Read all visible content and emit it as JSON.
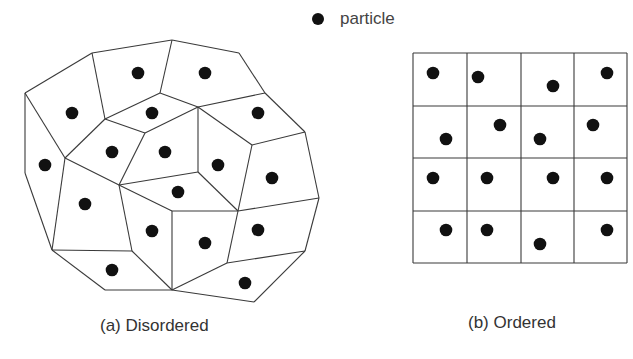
{
  "legend": {
    "marker": "filled-circle",
    "label": "particle"
  },
  "colors": {
    "line": "#3a3a3a",
    "particle": "#111111",
    "background": "#ffffff",
    "text": "#333333"
  },
  "panels": [
    {
      "id": "a",
      "caption": "(a) Disordered",
      "type": "voronoi-tessellation",
      "vertices": {
        "A": [
          25,
          93
        ],
        "B": [
          92,
          53
        ],
        "C": [
          172,
          40
        ],
        "D": [
          239,
          53
        ],
        "E": [
          265,
          93
        ],
        "F": [
          305,
          132
        ],
        "G": [
          319,
          198
        ],
        "H": [
          305,
          251
        ],
        "I": [
          254,
          302
        ],
        "J": [
          172,
          290
        ],
        "K": [
          105,
          290
        ],
        "L": [
          52,
          250
        ],
        "M": [
          25,
          173
        ],
        "N": [
          105,
          119
        ],
        "O": [
          160,
          93
        ],
        "P": [
          198,
          107
        ],
        "Q": [
          145,
          133
        ],
        "R": [
          65,
          158
        ],
        "S": [
          119,
          185
        ],
        "T": [
          252,
          145
        ],
        "U": [
          198,
          172
        ],
        "V": [
          238,
          211
        ],
        "W": [
          172,
          211
        ],
        "X": [
          132,
          251
        ],
        "Y": [
          227,
          263
        ]
      },
      "edges": [
        [
          "A",
          "B"
        ],
        [
          "B",
          "C"
        ],
        [
          "C",
          "D"
        ],
        [
          "D",
          "E"
        ],
        [
          "E",
          "F"
        ],
        [
          "F",
          "G"
        ],
        [
          "G",
          "H"
        ],
        [
          "H",
          "I"
        ],
        [
          "I",
          "J"
        ],
        [
          "J",
          "K"
        ],
        [
          "K",
          "L"
        ],
        [
          "L",
          "M"
        ],
        [
          "M",
          "A"
        ],
        [
          "B",
          "N"
        ],
        [
          "A",
          "R"
        ],
        [
          "N",
          "R"
        ],
        [
          "N",
          "O"
        ],
        [
          "O",
          "C"
        ],
        [
          "O",
          "P"
        ],
        [
          "E",
          "P"
        ],
        [
          "N",
          "Q"
        ],
        [
          "Q",
          "P"
        ],
        [
          "Q",
          "S"
        ],
        [
          "R",
          "S"
        ],
        [
          "R",
          "L"
        ],
        [
          "P",
          "T"
        ],
        [
          "T",
          "F"
        ],
        [
          "P",
          "U"
        ],
        [
          "U",
          "S"
        ],
        [
          "U",
          "V"
        ],
        [
          "T",
          "V"
        ],
        [
          "S",
          "W"
        ],
        [
          "W",
          "V"
        ],
        [
          "V",
          "G"
        ],
        [
          "W",
          "J"
        ],
        [
          "S",
          "X"
        ],
        [
          "X",
          "L"
        ],
        [
          "X",
          "J"
        ],
        [
          "V",
          "Y"
        ],
        [
          "Y",
          "H"
        ],
        [
          "Y",
          "J"
        ]
      ],
      "particles": [
        [
          138,
          73
        ],
        [
          205,
          73
        ],
        [
          72,
          113
        ],
        [
          152,
          113
        ],
        [
          258,
          113
        ],
        [
          45,
          165
        ],
        [
          112,
          152
        ],
        [
          165,
          152
        ],
        [
          218,
          165
        ],
        [
          272,
          178
        ],
        [
          178,
          192
        ],
        [
          85,
          204
        ],
        [
          152,
          231
        ],
        [
          205,
          243
        ],
        [
          258,
          230
        ],
        [
          112,
          270
        ],
        [
          245,
          283
        ]
      ]
    },
    {
      "id": "b",
      "caption": "(b) Ordered",
      "type": "square-grid",
      "grid": {
        "x": [
          413,
          467,
          521,
          574,
          627
        ],
        "y": [
          53,
          106,
          158,
          211,
          263
        ],
        "rows": 4,
        "cols": 4
      },
      "particles": [
        [
          433,
          73
        ],
        [
          478,
          77
        ],
        [
          553,
          86
        ],
        [
          607,
          73
        ],
        [
          446,
          139
        ],
        [
          500,
          125
        ],
        [
          540,
          139
        ],
        [
          593,
          125
        ],
        [
          433,
          178
        ],
        [
          487,
          178
        ],
        [
          553,
          178
        ],
        [
          607,
          178
        ],
        [
          446,
          230
        ],
        [
          487,
          230
        ],
        [
          540,
          244
        ],
        [
          607,
          230
        ]
      ]
    }
  ]
}
